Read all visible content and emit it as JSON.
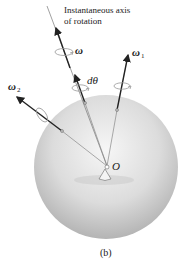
{
  "figure": {
    "axis_label_line1": "Instantaneous axis",
    "axis_label_line2": "of rotation",
    "omega_label": "ω",
    "dtheta_label": "dθ",
    "omega1_label": "ω",
    "omega1_sub": "1",
    "omega2_label": "ω",
    "omega2_sub": "2",
    "origin_label": "O",
    "caption": "(b)"
  },
  "colors": {
    "sphere_light": "#f4f4f4",
    "sphere_dark": "#b8b8b8",
    "vector": "#2a2a2a",
    "thin_line": "#8a8a8a"
  }
}
